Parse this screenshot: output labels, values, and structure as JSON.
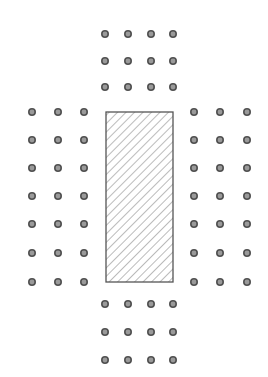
{
  "diagram": {
    "width": 268,
    "height": 377,
    "background": "#ffffff",
    "dot": {
      "radius": 3.2,
      "fill": "#9a9a9a",
      "stroke": "#505050",
      "stroke_width": 1.6
    },
    "hatched_rect": {
      "x": 106,
      "y": 112,
      "width": 67,
      "height": 170,
      "stroke": "#555555",
      "stroke_width": 1.3,
      "hatch_color": "#777777",
      "hatch_spacing": 6,
      "hatch_angle": 45
    },
    "dot_groups": [
      {
        "name": "top-group",
        "xs": [
          105,
          128,
          151,
          173
        ],
        "ys": [
          34,
          61,
          87
        ]
      },
      {
        "name": "left-group",
        "xs": [
          32,
          58,
          84
        ],
        "ys": [
          112,
          140,
          168,
          196,
          224,
          253,
          282
        ]
      },
      {
        "name": "right-group",
        "xs": [
          194,
          220,
          247
        ],
        "ys": [
          112,
          140,
          168,
          196,
          224,
          253,
          282
        ]
      },
      {
        "name": "bottom-group",
        "xs": [
          105,
          128,
          151,
          173
        ],
        "ys": [
          304,
          332,
          360
        ]
      }
    ]
  }
}
